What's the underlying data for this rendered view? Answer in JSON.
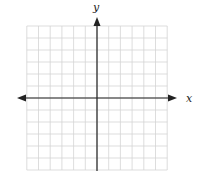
{
  "diagram": {
    "type": "coordinate-grid",
    "x_axis_label": "x",
    "y_axis_label": "y",
    "grid": {
      "columns_left_of_y_axis": 6,
      "columns_right_of_y_axis": 6,
      "rows_above_x_axis": 6,
      "rows_below_x_axis": 6
    },
    "colors": {
      "grid_line": "#d4d4d4",
      "axis_line": "#222222",
      "background": "#ffffff"
    }
  }
}
